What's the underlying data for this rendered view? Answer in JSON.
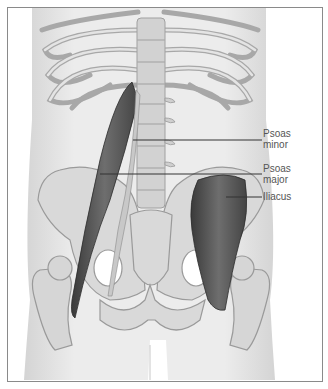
{
  "figure": {
    "labels": [
      {
        "id": "psoas-minor",
        "line1": "Psoas",
        "line2": "minor"
      },
      {
        "id": "psoas-major",
        "line1": "Psoas",
        "line2": "major"
      },
      {
        "id": "iliacus",
        "line1": "Iliacus",
        "line2": ""
      }
    ],
    "colors": {
      "body": "#e6e6e6",
      "bone": "#d9d9d9",
      "bone_outline": "#9a9a9a",
      "muscle": "#5f5f5f",
      "muscle_dark": "#3a3a3a",
      "leader_line": "#333333",
      "frame_border": "#8a8a8a"
    }
  }
}
